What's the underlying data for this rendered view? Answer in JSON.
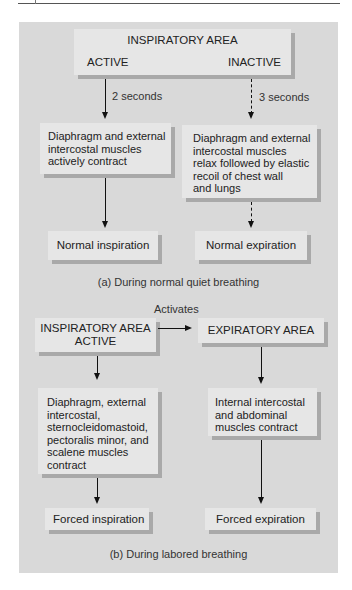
{
  "diagram": {
    "panel_a": {
      "top_box": {
        "title": "INSPIRATORY AREA",
        "left_label": "ACTIVE",
        "right_label": "INACTIVE"
      },
      "left_arrow_label": "2 seconds",
      "right_arrow_label": "3 seconds",
      "left_mid_box": [
        "Diaphragm and external",
        "intercostal muscles",
        "actively contract"
      ],
      "right_mid_box": [
        "Diaphragm and external",
        "intercostal muscles",
        "relax followed by elastic",
        "recoil of chest wall",
        "and lungs"
      ],
      "left_result": "Normal inspiration",
      "right_result": "Normal expiration",
      "caption": "(a) During normal quiet breathing"
    },
    "panel_b": {
      "activates_label": "Activates",
      "left_top_box": [
        "INSPIRATORY AREA",
        "ACTIVE"
      ],
      "right_top_box": "EXPIRATORY AREA",
      "left_mid_box": [
        "Diaphragm, external",
        "intercostal,",
        "sternocleidomastoid,",
        "pectoralis minor, and",
        "scalene muscles",
        "contract"
      ],
      "right_mid_box": [
        "Internal intercostal",
        "and abdominal",
        "muscles contract"
      ],
      "left_result": "Forced inspiration",
      "right_result": "Forced expiration",
      "caption": "(b) During labored breathing"
    }
  },
  "colors": {
    "panel_bg": "#d9d9d9",
    "box_bg": "#e6e6e6",
    "box_shadow": "#a9a9a9",
    "arrow": "#111111"
  }
}
